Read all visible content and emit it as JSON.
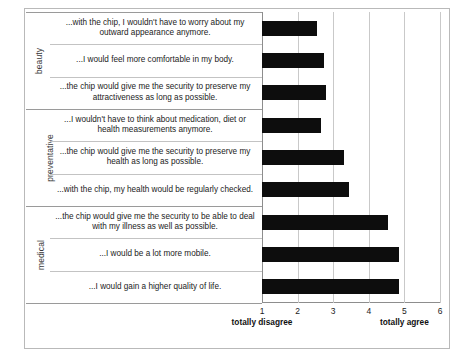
{
  "chart_data": {
    "type": "bar",
    "orientation": "horizontal",
    "title": "",
    "xlabel": "",
    "ylabel": "",
    "xlim": [
      1,
      6
    ],
    "xticks": [
      "1",
      "2",
      "3",
      "4",
      "5",
      "6"
    ],
    "grid": true,
    "legend": "none",
    "scale_anchor_low": "totally disagree",
    "scale_anchor_high": "totally agree",
    "groups": [
      {
        "name": "beauty",
        "items": [
          {
            "label": "...with the chip, I wouldn't have to worry about my outward appearance anymore.",
            "value": 2.55
          },
          {
            "label": "...I would feel more comfortable in my body.",
            "value": 2.75
          },
          {
            "label": "...the chip would give me the security to preserve my attractiveness as long as possible.",
            "value": 2.8
          }
        ]
      },
      {
        "name": "preventative",
        "items": [
          {
            "label": "...I wouldn't have to think about medication, diet or health measurements anymore.",
            "value": 2.65
          },
          {
            "label": "...the chip would give me the security to preserve my health as long as possible.",
            "value": 3.3
          },
          {
            "label": "...with the chip, my health would be regularly checked.",
            "value": 3.45
          }
        ]
      },
      {
        "name": "medical",
        "items": [
          {
            "label": "...the chip would give me the security to be able to deal with my illness as well as possible.",
            "value": 4.55
          },
          {
            "label": "...I would be a lot more mobile.",
            "value": 4.85
          },
          {
            "label": "...I would gain a higher quality of life.",
            "value": 4.85
          }
        ]
      }
    ],
    "bar_color": "#0d0d0d"
  }
}
